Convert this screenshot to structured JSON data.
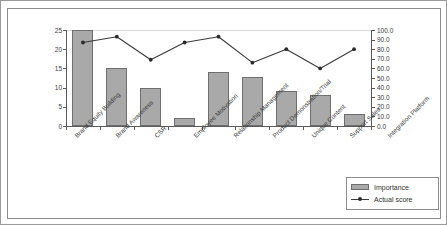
{
  "chart_data": {
    "type": "bar",
    "title": "",
    "xlabel": "",
    "ylabel": "",
    "ylim": [
      0,
      25
    ],
    "y2lim": [
      0,
      100
    ],
    "grid": true,
    "legend_position": "bottom-right",
    "categories": [
      "Brand Equity Building",
      "Brand Awareness",
      "CSR",
      "Employee Motivation",
      "Relationship Management",
      "Product Demonstration/Trial",
      "Unique Content",
      "Support Sales",
      "Integration Platform"
    ],
    "series": [
      {
        "name": "Importance",
        "type": "bar",
        "axis": "left",
        "color": "#a9a9a9",
        "values": [
          25,
          15,
          10,
          2,
          14,
          12.7,
          9,
          8,
          3
        ]
      },
      {
        "name": "Actual score",
        "type": "line",
        "axis": "right",
        "color": "#3a3a3a",
        "values": [
          87,
          93,
          69,
          87,
          93,
          66,
          80,
          60,
          80
        ]
      }
    ],
    "y_left_ticks": [
      "0",
      "5",
      "10",
      "15",
      "20",
      "25"
    ],
    "y_left_tick_values": [
      0,
      5,
      10,
      15,
      20,
      25
    ],
    "y_right_ticks": [
      "0.0",
      "10.0",
      "20.0",
      "30.0",
      "40.0",
      "50.0",
      "60.0",
      "70.0",
      "80.0",
      "90.0",
      "100.0"
    ],
    "y_right_tick_values": [
      0,
      10,
      20,
      30,
      40,
      50,
      60,
      70,
      80,
      90,
      100
    ]
  },
  "legend": {
    "items": [
      {
        "label": "Importance"
      },
      {
        "label": "Actual score"
      }
    ]
  }
}
